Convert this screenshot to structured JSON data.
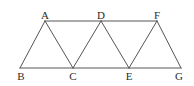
{
  "figure": {
    "name": "triangular-strip-diagram",
    "background_color": "#ffffff",
    "stroke_color": "#555555",
    "stroke_width": 1,
    "width": 194,
    "height": 86
  },
  "labels": {
    "A": "A",
    "B": "B",
    "C": "C",
    "D": "D",
    "E": "E",
    "F": "F",
    "G": "G"
  },
  "chart_data": {
    "type": "scatter",
    "title": "",
    "xlabel": "",
    "ylabel": "",
    "grid": false,
    "legend": "none",
    "xlim": [
      0,
      194
    ],
    "ylim": [
      86,
      0
    ],
    "points": [
      {
        "label": "A",
        "x": 45,
        "y": 21,
        "label_position": "above"
      },
      {
        "label": "B",
        "x": 20,
        "y": 68,
        "label_position": "below"
      },
      {
        "label": "C",
        "x": 73,
        "y": 68,
        "label_position": "below"
      },
      {
        "label": "D",
        "x": 101,
        "y": 21,
        "label_position": "above"
      },
      {
        "label": "E",
        "x": 129,
        "y": 68,
        "label_position": "below"
      },
      {
        "label": "F",
        "x": 157,
        "y": 21,
        "label_position": "above"
      },
      {
        "label": "G",
        "x": 181,
        "y": 68,
        "label_position": "below"
      }
    ],
    "segments": [
      {
        "name": "top-edge-A-F",
        "from": "A",
        "to": "F",
        "x1": 45,
        "y1": 21,
        "x2": 157,
        "y2": 21
      },
      {
        "name": "bottom-edge-B-G",
        "from": "B",
        "to": "G",
        "x1": 20,
        "y1": 68,
        "x2": 181,
        "y2": 68
      },
      {
        "name": "edge-B-A",
        "from": "B",
        "to": "A",
        "x1": 20,
        "y1": 68,
        "x2": 45,
        "y2": 21
      },
      {
        "name": "edge-A-C",
        "from": "A",
        "to": "C",
        "x1": 45,
        "y1": 21,
        "x2": 73,
        "y2": 68
      },
      {
        "name": "edge-C-D",
        "from": "C",
        "to": "D",
        "x1": 73,
        "y1": 68,
        "x2": 101,
        "y2": 21
      },
      {
        "name": "edge-D-E",
        "from": "D",
        "to": "E",
        "x1": 101,
        "y1": 21,
        "x2": 129,
        "y2": 68
      },
      {
        "name": "edge-E-F",
        "from": "E",
        "to": "F",
        "x1": 129,
        "y1": 68,
        "x2": 157,
        "y2": 21
      },
      {
        "name": "edge-F-G",
        "from": "F",
        "to": "G",
        "x1": 157,
        "y1": 21,
        "x2": 181,
        "y2": 68
      }
    ],
    "label_offsets": {
      "above_dy": -11,
      "below_dy": 3
    }
  }
}
